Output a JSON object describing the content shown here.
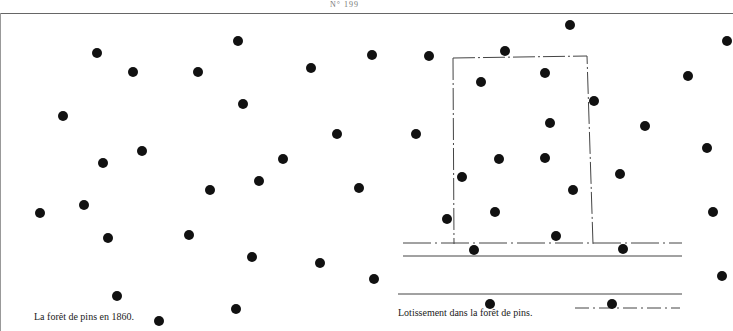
{
  "page_number": "N° 199",
  "left_figure": {
    "caption": "La forêt de pins en 1860.",
    "trees": [
      [
        97,
        53
      ],
      [
        133,
        72
      ],
      [
        238,
        41
      ],
      [
        198,
        72
      ],
      [
        311,
        68
      ],
      [
        372,
        55
      ],
      [
        63,
        116
      ],
      [
        243,
        104
      ],
      [
        337,
        134
      ],
      [
        103,
        163
      ],
      [
        142,
        151
      ],
      [
        283,
        159
      ],
      [
        210,
        190
      ],
      [
        259,
        181
      ],
      [
        359,
        188
      ],
      [
        40,
        213
      ],
      [
        84,
        205
      ],
      [
        108,
        238
      ],
      [
        189,
        235
      ],
      [
        252,
        257
      ],
      [
        320,
        263
      ],
      [
        374,
        279
      ],
      [
        117,
        296
      ],
      [
        159,
        321
      ],
      [
        236,
        309
      ]
    ]
  },
  "right_figure": {
    "caption": "Lotissement dans la forêt de pins.",
    "trees": [
      [
        429,
        56
      ],
      [
        505,
        51
      ],
      [
        570,
        25
      ],
      [
        727,
        41
      ],
      [
        481,
        82
      ],
      [
        545,
        73
      ],
      [
        688,
        76
      ],
      [
        594,
        101
      ],
      [
        550,
        123
      ],
      [
        645,
        126
      ],
      [
        416,
        134
      ],
      [
        707,
        148
      ],
      [
        499,
        159
      ],
      [
        545,
        158
      ],
      [
        462,
        177
      ],
      [
        620,
        174
      ],
      [
        573,
        190
      ],
      [
        447,
        219
      ],
      [
        495,
        212
      ],
      [
        713,
        212
      ],
      [
        556,
        236
      ],
      [
        474,
        250
      ],
      [
        623,
        249
      ],
      [
        722,
        276
      ],
      [
        490,
        304
      ],
      [
        612,
        304
      ]
    ]
  }
}
